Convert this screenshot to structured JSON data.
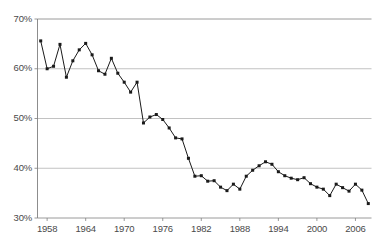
{
  "chart_data": {
    "type": "line",
    "title": "",
    "subtitle": "",
    "xlabel": "",
    "ylabel": "",
    "grid": true,
    "legend": null,
    "xlim": [
      1956.5,
      2008.5
    ],
    "ylim": [
      30,
      70
    ],
    "y_tick_labels": [
      "70%",
      "60%",
      "50%",
      "40%",
      "30%"
    ],
    "y_ticks": [
      70,
      60,
      50,
      40,
      30
    ],
    "x_tick_labels": [
      "1958",
      "1964",
      "1970",
      "1976",
      "1982",
      "1988",
      "1994",
      "2000",
      "2006"
    ],
    "x_ticks": [
      1958,
      1964,
      1970,
      1976,
      1982,
      1988,
      1994,
      2000,
      2006
    ],
    "series_name": "",
    "marker": "square",
    "line_color": "#1a1a1a",
    "marker_color": "#1a1a1a",
    "grid_color": "#b3b3b3",
    "axis_color": "#808080",
    "x": [
      1957,
      1958,
      1959,
      1960,
      1961,
      1962,
      1963,
      1964,
      1965,
      1966,
      1967,
      1968,
      1969,
      1970,
      1971,
      1972,
      1973,
      1974,
      1975,
      1976,
      1977,
      1978,
      1979,
      1980,
      1981,
      1982,
      1983,
      1984,
      1985,
      1986,
      1987,
      1988,
      1989,
      1990,
      1991,
      1992,
      1993,
      1994,
      1995,
      1996,
      1997,
      1998,
      1999,
      2000,
      2001,
      2002,
      2003,
      2004,
      2005,
      2006,
      2007,
      2008
    ],
    "y": [
      65.6,
      60.0,
      60.5,
      64.9,
      58.3,
      61.6,
      63.8,
      65.1,
      62.8,
      59.6,
      58.9,
      62.1,
      59.1,
      57.3,
      55.3,
      57.3,
      49.1,
      50.3,
      50.8,
      49.8,
      48.1,
      46.1,
      45.9,
      42.0,
      38.4,
      38.5,
      37.4,
      37.5,
      36.2,
      35.5,
      36.8,
      35.8,
      38.4,
      39.6,
      40.5,
      41.3,
      40.8,
      39.3,
      38.5,
      38.0,
      37.7,
      38.1,
      36.9,
      36.2,
      35.8,
      34.5,
      36.8,
      36.1,
      35.4,
      36.8,
      35.6,
      32.9
    ]
  },
  "axes": {
    "y_axis_name": "percent-axis",
    "x_axis_name": "year-axis"
  }
}
